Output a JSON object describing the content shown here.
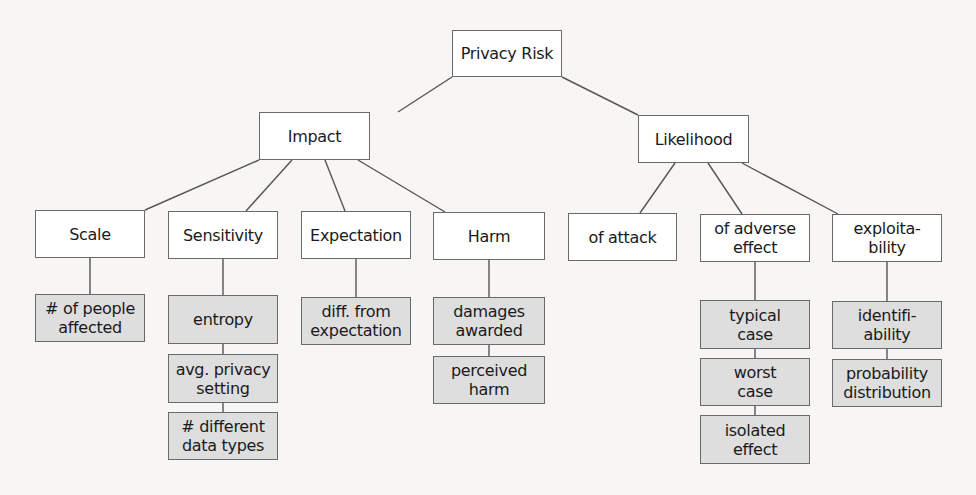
{
  "diagram": {
    "title": "Privacy Risk",
    "root": {
      "id": "privacy-risk",
      "label": "Privacy Risk"
    },
    "level1": [
      {
        "id": "impact",
        "label": "Impact"
      },
      {
        "id": "likelihood",
        "label": "Likelihood"
      }
    ],
    "level2": [
      {
        "id": "scale",
        "parent": "impact",
        "label": "Scale"
      },
      {
        "id": "sensitivity",
        "parent": "impact",
        "label": "Sensitivity"
      },
      {
        "id": "expectation",
        "parent": "impact",
        "label": "Expectation"
      },
      {
        "id": "harm",
        "parent": "impact",
        "label": "Harm"
      },
      {
        "id": "of-attack",
        "parent": "likelihood",
        "label": "of attack"
      },
      {
        "id": "of-adverse-effect",
        "parent": "likelihood",
        "label": "of adverse\neffect"
      },
      {
        "id": "exploitability",
        "parent": "likelihood",
        "label": "exploita-\nbility"
      }
    ],
    "metrics": [
      {
        "id": "num-people-affected",
        "parent": "scale",
        "label": "# of people\naffected"
      },
      {
        "id": "entropy",
        "parent": "sensitivity",
        "label": "entropy"
      },
      {
        "id": "avg-privacy-setting",
        "parent": "sensitivity",
        "label": "avg. privacy\nsetting"
      },
      {
        "id": "num-different-data-types",
        "parent": "sensitivity",
        "label": "# different\ndata types"
      },
      {
        "id": "diff-from-expectation",
        "parent": "expectation",
        "label": "diff. from\nexpectation"
      },
      {
        "id": "damages-awarded",
        "parent": "harm",
        "label": "damages\nawarded"
      },
      {
        "id": "perceived-harm",
        "parent": "harm",
        "label": "perceived\nharm"
      },
      {
        "id": "typical-case",
        "parent": "of-adverse-effect",
        "label": "typical\ncase"
      },
      {
        "id": "worst-case",
        "parent": "of-adverse-effect",
        "label": "worst\ncase"
      },
      {
        "id": "isolated-effect",
        "parent": "of-adverse-effect",
        "label": "isolated\neffect"
      },
      {
        "id": "identifiability",
        "parent": "exploitability",
        "label": "identifi-\nability"
      },
      {
        "id": "probability-distribution",
        "parent": "exploitability",
        "label": "probability\ndistribution"
      }
    ],
    "colors": {
      "category_fill": "#ffffff",
      "metric_fill": "#dedede",
      "border": "#6a6a6a",
      "edge": "#555555"
    }
  }
}
